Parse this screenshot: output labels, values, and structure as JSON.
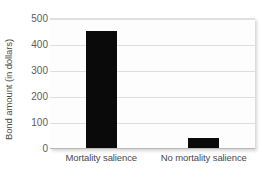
{
  "chart_data": {
    "type": "bar",
    "title": "",
    "xlabel": "",
    "ylabel": "Bond amount (in dollars)",
    "categories": [
      "Mortality salience",
      "No mortality salience"
    ],
    "values": [
      450,
      40
    ],
    "ylim": [
      0,
      500
    ],
    "yticks": [
      0,
      100,
      200,
      300,
      400,
      500
    ],
    "ytick_labels": [
      "0",
      "100",
      "200",
      "300",
      "400",
      "500"
    ],
    "grid": true,
    "legend": null,
    "bar_color": "#0a0a0a",
    "grid_color": "#dedede",
    "plot_background": "#fdfdfd"
  }
}
